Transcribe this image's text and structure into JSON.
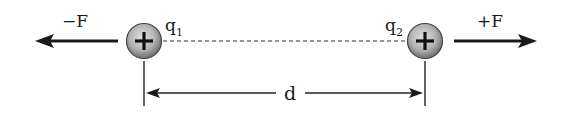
{
  "diagram": {
    "charges": [
      {
        "id": "q1",
        "label": "q",
        "subscript": "1",
        "sign": "+"
      },
      {
        "id": "q2",
        "label": "q",
        "subscript": "2",
        "sign": "+"
      }
    ],
    "forces": [
      {
        "id": "left",
        "label": "−F",
        "direction": "left"
      },
      {
        "id": "right",
        "label": "+F",
        "direction": "right"
      }
    ],
    "distance": {
      "label": "d"
    },
    "colors": {
      "ink": "#1a1a1a",
      "charge_fill_center": "#d9d9d9",
      "charge_fill_edge": "#7a7a7a",
      "background": "#ffffff"
    }
  }
}
